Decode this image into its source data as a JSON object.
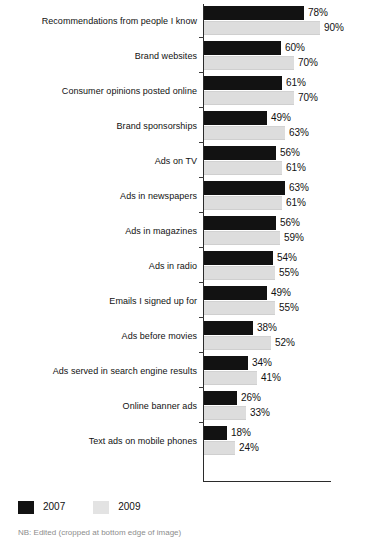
{
  "chart_data": {
    "type": "bar",
    "orientation": "horizontal",
    "title": "",
    "xlabel": "",
    "ylabel": "",
    "xlim": [
      0,
      100
    ],
    "grid": false,
    "legend_position": "bottom-left",
    "value_suffix": "%",
    "categories": [
      "Recommendations from people I know",
      "Brand websites",
      "Consumer opinions posted online",
      "Brand sponsorships",
      "Ads on TV",
      "Ads in newspapers",
      "Ads in magazines",
      "Ads in radio",
      "Emails I signed up for",
      "Ads before movies",
      "Ads served in search engine results",
      "Online banner ads",
      "Text ads on mobile phones"
    ],
    "series": [
      {
        "name": "2007",
        "color": "#121212",
        "values": [
          78,
          60,
          61,
          49,
          56,
          63,
          56,
          54,
          49,
          38,
          34,
          26,
          18
        ],
        "labels": [
          "78%",
          "60%",
          "61%",
          "49%",
          "56%",
          "63%",
          "56%",
          "54%",
          "49%",
          "38%",
          "34%",
          "26%",
          "18%"
        ]
      },
      {
        "name": "2009",
        "color": "#dddddd",
        "values": [
          90,
          70,
          70,
          63,
          61,
          61,
          59,
          55,
          55,
          52,
          41,
          33,
          24
        ],
        "labels": [
          "90%",
          "70%",
          "70%",
          "63%",
          "61%",
          "61%",
          "59%",
          "55%",
          "55%",
          "52%",
          "41%",
          "33%",
          "24%"
        ]
      }
    ]
  },
  "legend": {
    "items": [
      {
        "label": "2007",
        "color": "#121212"
      },
      {
        "label": "2009",
        "color": "#e3e3e3"
      }
    ]
  },
  "footnote": {
    "text": "NB: Edited (cropped at bottom edge of image)"
  }
}
